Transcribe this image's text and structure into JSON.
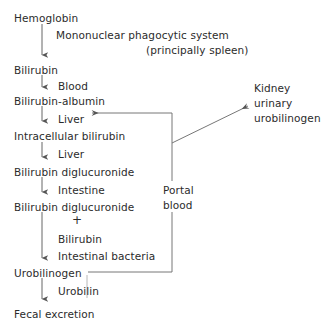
{
  "diagram": {
    "ink_color": "#2b2b2b",
    "background_color": "#ffffff",
    "nodes": [
      {
        "id": "hemoglobin",
        "label": "Hemoglobin",
        "x": 14,
        "y": 12
      },
      {
        "id": "bilirubin",
        "label": "Bilirubin",
        "x": 14,
        "y": 64
      },
      {
        "id": "bilirubin-albumin",
        "label": "Bilirubin-albumin",
        "x": 14,
        "y": 95
      },
      {
        "id": "intracellular-bilirubin",
        "label": "Intracellular bilirubin",
        "x": 14,
        "y": 130
      },
      {
        "id": "bilirubin-diglucuronide-1",
        "label": "Bilirubin diglucuronide",
        "x": 14,
        "y": 166
      },
      {
        "id": "bilirubin-diglucuronide-2",
        "label": "Bilirubin diglucuronide",
        "x": 14,
        "y": 201
      },
      {
        "id": "urobilinogen",
        "label": "Urobilinogen",
        "x": 14,
        "y": 267
      },
      {
        "id": "fecal-excretion",
        "label": "Fecal excretion",
        "x": 14,
        "y": 308
      },
      {
        "id": "kidney-urinary-urobilinogen-line1",
        "label": "Kidney",
        "x": 254,
        "y": 82
      },
      {
        "id": "kidney-urinary-urobilinogen-line2",
        "label": "urinary",
        "x": 254,
        "y": 97
      },
      {
        "id": "kidney-urinary-urobilinogen-line3",
        "label": "urobilinogen",
        "x": 254,
        "y": 112
      },
      {
        "id": "portal-blood-line1",
        "label": "Portal",
        "x": 163,
        "y": 184
      },
      {
        "id": "portal-blood-line2",
        "label": "blood",
        "x": 163,
        "y": 199
      }
    ],
    "edge_labels": [
      {
        "id": "mononuclear-phagocytic-system",
        "label": "Mononuclear phagocytic system",
        "x": 56,
        "y": 29
      },
      {
        "id": "principally-spleen",
        "label": "(principally spleen)",
        "x": 146,
        "y": 44
      },
      {
        "id": "blood",
        "label": "Blood",
        "x": 58,
        "y": 80
      },
      {
        "id": "liver-1",
        "label": "Liver",
        "x": 58,
        "y": 113
      },
      {
        "id": "liver-2",
        "label": "Liver",
        "x": 58,
        "y": 148
      },
      {
        "id": "intestine",
        "label": "Intestine",
        "x": 58,
        "y": 184
      },
      {
        "id": "plus",
        "label": "+",
        "x": 72,
        "y": 216
      },
      {
        "id": "free-bilirubin",
        "label": "Bilirubin",
        "x": 58,
        "y": 233
      },
      {
        "id": "intestinal-bacteria",
        "label": "Intestinal bacteria",
        "x": 58,
        "y": 250
      },
      {
        "id": "urobilin",
        "label": "Urobilin",
        "x": 58,
        "y": 285
      }
    ],
    "arrows": [
      {
        "id": "hemoglobin-to-bilirubin",
        "from": "hemoglobin",
        "to": "bilirubin",
        "direction": "down"
      },
      {
        "id": "bilirubin-to-bilirubin-albumin",
        "from": "bilirubin",
        "to": "bilirubin-albumin",
        "direction": "down"
      },
      {
        "id": "bilirubin-albumin-to-intracellular",
        "from": "bilirubin-albumin",
        "to": "intracellular-bilirubin",
        "direction": "down"
      },
      {
        "id": "intracellular-to-diglucuronide",
        "from": "intracellular-bilirubin",
        "to": "bilirubin-diglucuronide-1",
        "direction": "down"
      },
      {
        "id": "diglucuronide-to-diglucuronide",
        "from": "bilirubin-diglucuronide-1",
        "to": "bilirubin-diglucuronide-2",
        "direction": "down"
      },
      {
        "id": "diglucuronide-to-urobilinogen",
        "from": "bilirubin-diglucuronide-2",
        "to": "urobilinogen",
        "direction": "down"
      },
      {
        "id": "urobilinogen-to-fecal-excretion",
        "from": "urobilinogen",
        "to": "fecal-excretion",
        "direction": "down"
      },
      {
        "id": "portal-blood-to-liver",
        "from": "urobilinogen",
        "to": "liver-1",
        "direction": "enterohepatic-recirculation"
      },
      {
        "id": "portal-blood-to-kidney",
        "from": "portal-blood",
        "to": "kidney-urinary-urobilinogen",
        "direction": "diagonal-up-right"
      }
    ]
  }
}
